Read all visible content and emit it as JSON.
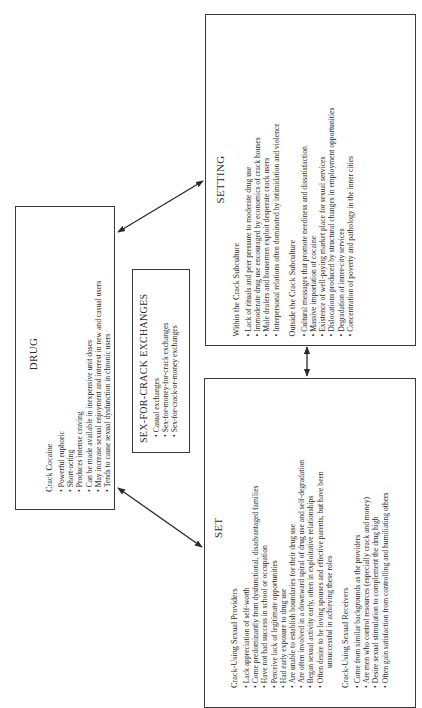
{
  "drug": {
    "title": "DRUG",
    "subtitle": "Crack Cocaine",
    "items": [
      "Powerful euphoric",
      "Short-acting",
      "Produces intense craving",
      "Can be made available in inexpensive unit doses",
      "May increase sexual enjoyment and interest in new and casual users",
      "Tends to cause sexual dysfunction in chronic users"
    ]
  },
  "exchanges": {
    "title": "SEX-FOR-CRACK EXCHANGES",
    "items": [
      "Casual exchanges",
      "Sex-for-money-for-crack exchanges",
      "Sex-for-crack-or-money exchanges"
    ]
  },
  "setting": {
    "title": "SETTING",
    "sections": [
      {
        "heading": "Within the Crack Subculture",
        "items": [
          "Lack of rituals and peer pressure to moderate drug use",
          "Immoderate drug use encouraged by economics of crack houses",
          "Male dealers and housemen exploit desperate crack users",
          "Interpersonal relations often dominated by intimidation and violence"
        ]
      },
      {
        "heading": "Outside the Crack Subculture",
        "items": [
          "Cultural messages that promote neediness and dissatisfaction",
          "Massive importation of cocaine",
          "Existence of well-paying market place for sexual services",
          "Dislocations produced by structural changes in employment opportunities",
          "Degradation of inner-city services",
          "Concentration of poverty and pathology in the inner cities"
        ]
      }
    ]
  },
  "set": {
    "title": "SET",
    "sections": [
      {
        "heading": "Crack-Using Sexual Providers",
        "items": [
          "Lack appreciation of self-worth",
          "Come predominantly from dysfunctional, disadvantaged families",
          "Have not had success in school or occupation",
          "Perceive lack of legitimate opportunities",
          "Had early exposure to drug use",
          "Are unable to establish boundaries for their drug use",
          "Are often involved in a downward spiral of drug use and self-degradation",
          "Began sexual activity early, often in exploitative relationships",
          "Often desire to be loving spouses and effective parents, but have been"
        ],
        "continuation": "unsuccessful in achieving these roles"
      },
      {
        "heading": "Crack-Using Sexual Receivers",
        "items": [
          "Come from similar backgrounds as the providers",
          "Are men who control resources (especially crack and money)",
          "Desire sexual stimulation to complement the drug high",
          "Often gain satisfaction from controlling and humiliating others"
        ]
      }
    ]
  },
  "colors": {
    "line": "#3a3a3a",
    "text": "#2a2a2a",
    "background": "#ffffff"
  }
}
